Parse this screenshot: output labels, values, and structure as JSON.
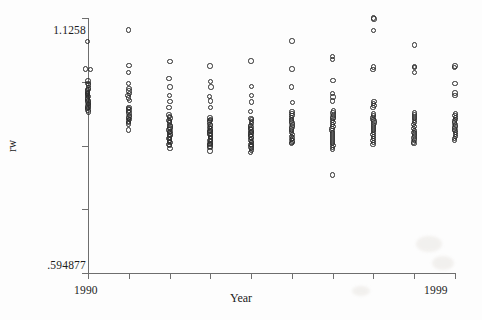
{
  "axes": {
    "y_title": "rw",
    "x_title": "Year",
    "y_max_label": "1.1258",
    "y_min_label": ".594877",
    "x_min_label": "1990",
    "x_max_label": "1999"
  },
  "chart_data": {
    "type": "scatter",
    "title": "",
    "subtitle": "",
    "xlabel": "Year",
    "ylabel": "rw",
    "xlim": [
      1990,
      1999
    ],
    "ylim": [
      0.594877,
      1.1258
    ],
    "grid": false,
    "legend": null,
    "marker": "open-circle",
    "n_y_ticks": 5,
    "n_x_ticks": 10,
    "series": [
      {
        "name": "rw",
        "points_by_year": [
          {
            "x": 1990,
            "y": [
              1.077,
              1.02,
              1.019,
              0.995,
              0.99,
              0.986,
              0.98,
              0.977,
              0.974,
              0.971,
              0.969,
              0.967,
              0.964,
              0.962,
              0.959,
              0.957,
              0.954,
              0.951,
              0.948,
              0.946,
              0.943,
              0.94,
              0.937,
              0.934,
              0.93
            ]
          },
          {
            "x": 1991,
            "y": [
              1.101,
              1.027,
              1.012,
              0.989,
              0.979,
              0.974,
              0.969,
              0.964,
              0.959,
              0.954,
              0.94,
              0.937,
              0.934,
              0.931,
              0.928,
              0.923,
              0.92,
              0.917,
              0.914,
              0.911,
              0.908,
              0.905,
              0.893
            ]
          },
          {
            "x": 1992,
            "y": [
              1.035,
              1.0,
              0.982,
              0.964,
              0.952,
              0.939,
              0.924,
              0.921,
              0.918,
              0.913,
              0.91,
              0.907,
              0.902,
              0.899,
              0.896,
              0.893,
              0.89,
              0.887,
              0.884,
              0.881,
              0.878,
              0.875,
              0.872,
              0.869,
              0.866,
              0.863,
              0.86,
              0.854
            ]
          },
          {
            "x": 1993,
            "y": [
              1.026,
              0.994,
              0.982,
              0.962,
              0.953,
              0.94,
              0.918,
              0.915,
              0.912,
              0.909,
              0.904,
              0.901,
              0.898,
              0.895,
              0.892,
              0.889,
              0.886,
              0.883,
              0.88,
              0.877,
              0.874,
              0.871,
              0.868,
              0.865,
              0.862,
              0.859,
              0.856,
              0.849
            ]
          },
          {
            "x": 1994,
            "y": [
              1.036,
              0.983,
              0.964,
              0.951,
              0.931,
              0.917,
              0.914,
              0.91,
              0.906,
              0.902,
              0.899,
              0.896,
              0.893,
              0.89,
              0.887,
              0.884,
              0.881,
              0.878,
              0.875,
              0.872,
              0.869,
              0.866,
              0.863,
              0.86,
              0.857,
              0.854,
              0.85,
              0.846
            ]
          },
          {
            "x": 1995,
            "y": [
              1.078,
              1.02,
              0.982,
              0.95,
              0.931,
              0.927,
              0.923,
              0.919,
              0.915,
              0.911,
              0.907,
              0.903,
              0.899,
              0.895,
              0.891,
              0.887,
              0.883,
              0.879,
              0.876,
              0.873,
              0.87,
              0.867,
              0.864
            ]
          },
          {
            "x": 1996,
            "y": [
              1.046,
              1.04,
              0.996,
              0.969,
              0.961,
              0.953,
              0.932,
              0.928,
              0.924,
              0.92,
              0.916,
              0.912,
              0.908,
              0.904,
              0.9,
              0.896,
              0.892,
              0.888,
              0.884,
              0.88,
              0.876,
              0.872,
              0.868,
              0.864,
              0.86,
              0.856,
              0.852,
              0.799
            ]
          },
          {
            "x": 1997,
            "y": [
              1.1258,
              1.124,
              1.1,
              1.024,
              1.018,
              0.952,
              0.948,
              0.944,
              0.94,
              0.926,
              0.923,
              0.919,
              0.915,
              0.911,
              0.907,
              0.903,
              0.899,
              0.895,
              0.891,
              0.887,
              0.883,
              0.879,
              0.875,
              0.871,
              0.867,
              0.863
            ]
          },
          {
            "x": 1998,
            "y": [
              1.07,
              1.025,
              1.023,
              1.012,
              0.928,
              0.924,
              0.92,
              0.916,
              0.912,
              0.908,
              0.904,
              0.9,
              0.896,
              0.892,
              0.888,
              0.884,
              0.88,
              0.876,
              0.872,
              0.868,
              0.864
            ]
          },
          {
            "x": 1999,
            "y": [
              1.026,
              1.023,
              0.99,
              0.97,
              0.965,
              0.927,
              0.923,
              0.919,
              0.915,
              0.911,
              0.907,
              0.903,
              0.899,
              0.895,
              0.891,
              0.887,
              0.883,
              0.879,
              0.875,
              0.871
            ]
          }
        ]
      }
    ]
  }
}
